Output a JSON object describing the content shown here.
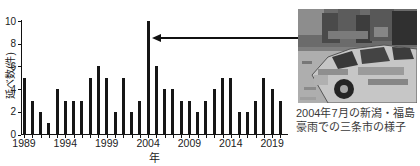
{
  "figure": {
    "background": "#ffffff",
    "bar_color": "#161616",
    "axis_color": "#111111",
    "text_color": "#222222"
  },
  "chart_data": {
    "type": "bar",
    "title": "",
    "xlabel": "年",
    "ylabel": "延べ数(件)",
    "ylim": [
      0,
      10
    ],
    "yticks": [
      0,
      2,
      4,
      6,
      8,
      10
    ],
    "labeled_years": [
      1989,
      1994,
      1999,
      2004,
      2009,
      2014,
      2019
    ],
    "categories": [
      1989,
      1990,
      1991,
      1992,
      1993,
      1994,
      1995,
      1996,
      1997,
      1998,
      1999,
      2000,
      2001,
      2002,
      2003,
      2004,
      2005,
      2006,
      2007,
      2008,
      2009,
      2010,
      2011,
      2012,
      2013,
      2014,
      2015,
      2016,
      2017,
      2018,
      2019,
      2020
    ],
    "values": [
      5,
      3,
      2,
      1,
      4,
      3,
      3,
      3,
      5,
      6,
      5,
      2,
      5,
      2,
      3,
      10,
      6,
      4,
      4,
      3,
      3,
      2,
      3,
      4,
      5,
      5,
      2,
      2,
      3,
      5,
      4,
      3
    ],
    "grid": false,
    "legend": null,
    "annotation": {
      "type": "arrow",
      "target_year": 2004,
      "target_value": 10
    }
  },
  "photo": {
    "caption_line1": "2004年7月の新潟・福島",
    "caption_line2": "豪雨での三条市の様子"
  }
}
